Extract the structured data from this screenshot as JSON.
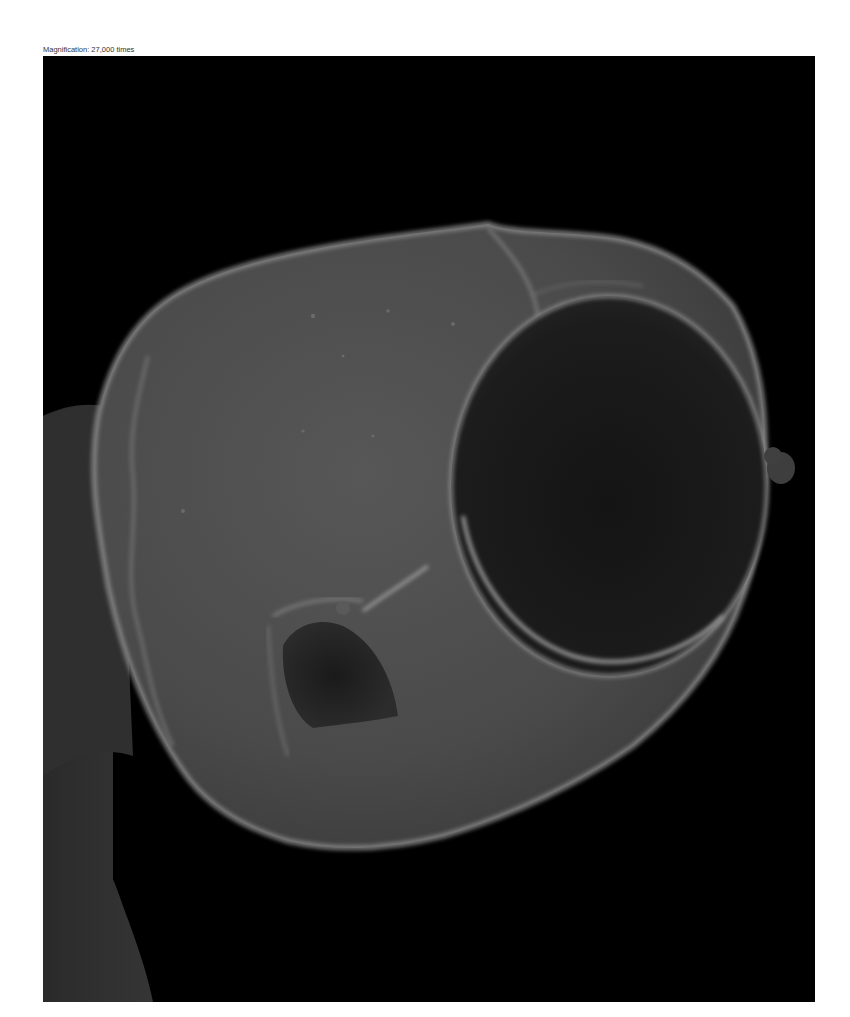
{
  "caption": {
    "text": "Magnification: 27,000 times"
  },
  "micrograph": {
    "type": "scanning-electron-micrograph",
    "colors": {
      "background": "#000000",
      "body_fill": "#4a4a4a",
      "rim_highlight": "#9a9a9a",
      "opening_dark": "#1a1a1a",
      "secondary_object": "#2e2e2e"
    }
  }
}
